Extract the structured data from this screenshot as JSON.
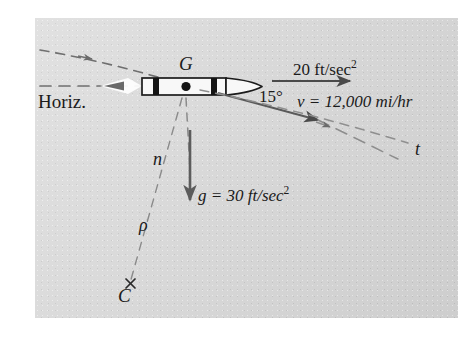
{
  "figure": {
    "domain_note": "mechanics free-body / kinematics diagram of a rocket in flight",
    "plate_background_color": "#d7d7d7",
    "page_background_color": "#ffffff",
    "ink_color": "#1b1b1b",
    "line_color": "#5a5a5a",
    "body_fill_color": "#f7f7f7",
    "band_color": "#141414"
  },
  "labels": {
    "horizontal_reference": "Horiz.",
    "center_of_mass": "G",
    "acceleration_value": "20 ft/sec",
    "acceleration_exponent": "2",
    "angle": "15°",
    "velocity": "v = 12,000 mi/hr",
    "gravity_value": "g = 30 ft/sec",
    "gravity_exponent": "2",
    "normal_axis": "n",
    "radius_of_curvature": "ρ",
    "center_of_curvature": "C",
    "tangent_axis": "t"
  },
  "vectors": [
    {
      "name": "acceleration",
      "label": "20 ft/sec^2",
      "direction": "horizontal-right",
      "style": "solid"
    },
    {
      "name": "velocity",
      "label": "v = 12,000 mi/hr",
      "direction": "down-right 15 degrees",
      "style": "solid"
    },
    {
      "name": "gravity",
      "label": "g = 30 ft/sec^2",
      "direction": "vertical-down",
      "style": "solid"
    }
  ],
  "construction_lines": [
    {
      "name": "horizontal-reference",
      "style": "dashed",
      "label": "Horiz."
    },
    {
      "name": "trajectory-path",
      "style": "dashed",
      "label": "t"
    },
    {
      "name": "normal-line-to-center",
      "style": "dashed",
      "label": "n / ρ"
    }
  ]
}
